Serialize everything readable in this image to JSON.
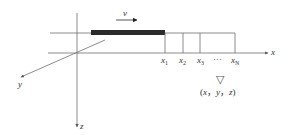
{
  "diagram": {
    "type": "physics-coordinate-diagram",
    "axes": {
      "x": {
        "label": "x"
      },
      "y": {
        "label": "y"
      },
      "z": {
        "label": "z"
      }
    },
    "moving_load": {
      "velocity_label": "v"
    },
    "points": [
      {
        "name": "x",
        "sub": "1"
      },
      {
        "name": "x",
        "sub": "2"
      },
      {
        "name": "x",
        "sub": "3"
      },
      {
        "name": "x",
        "sub": "N"
      }
    ],
    "ellipsis": "···",
    "observer": {
      "marker": "▽",
      "label_open": "(",
      "x": "x",
      "y": "y",
      "z": "z",
      "sep": "，",
      "label_close": ")"
    },
    "colors": {
      "line": "#6e6e6e",
      "bar": "#2b2b2b",
      "text": "#333333"
    }
  }
}
